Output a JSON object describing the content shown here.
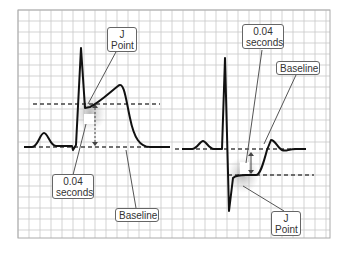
{
  "figure": {
    "grid": {
      "x": 18,
      "y": 10,
      "width": 312,
      "height": 228,
      "cell": 11,
      "color": "#c8c8c8",
      "border": "#aaaaaa"
    },
    "colors": {
      "trace": "#111111",
      "dashed": "#444444",
      "leader": "#555555",
      "glow": "#bbbbbb"
    },
    "panels": [
      {
        "name": "st-elevation",
        "labels": [
          {
            "id": "j-point",
            "line1": "J",
            "line2": "Point",
            "x": 107,
            "y": 27,
            "w": 30,
            "h": 25
          },
          {
            "id": "duration",
            "line1": "0.04",
            "line2": "seconds",
            "x": 52,
            "y": 174,
            "w": 42,
            "h": 25
          },
          {
            "id": "baseline",
            "line1": "Baseline",
            "line2": "",
            "x": 115,
            "y": 208,
            "w": 44,
            "h": 14
          }
        ]
      },
      {
        "name": "st-depression",
        "labels": [
          {
            "id": "duration",
            "line1": "0.04",
            "line2": "seconds",
            "x": 242,
            "y": 24,
            "w": 42,
            "h": 25
          },
          {
            "id": "baseline",
            "line1": "Baseline",
            "line2": "",
            "x": 276,
            "y": 61,
            "w": 44,
            "h": 14
          },
          {
            "id": "j-point",
            "line1": "J",
            "line2": "Point",
            "x": 271,
            "y": 211,
            "w": 30,
            "h": 25
          }
        ]
      }
    ]
  }
}
